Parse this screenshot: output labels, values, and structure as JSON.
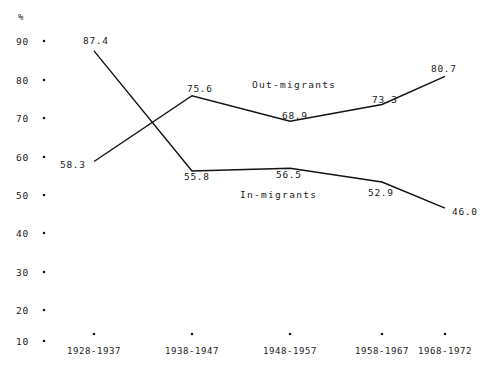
{
  "chart_data": {
    "type": "line",
    "title": "",
    "xlabel": "",
    "ylabel": "%",
    "ylim": [
      10,
      90
    ],
    "ytick_step": 10,
    "grid": false,
    "legend_position": "inline-annotation",
    "yticks": [
      "90",
      "80",
      "70",
      "60",
      "50",
      "40",
      "30",
      "20",
      "10"
    ],
    "categories": [
      "1928-1937",
      "1938-1947",
      "1948-1957",
      "1958-1967",
      "1968-1972"
    ],
    "series": [
      {
        "name": "Out-migrants",
        "values": [
          58.3,
          75.6,
          68.9,
          73.3,
          80.7
        ],
        "labels": [
          "58.3",
          "75.6",
          "68.9",
          "73.3",
          "80.7"
        ]
      },
      {
        "name": "In-migrants",
        "values": [
          87.4,
          55.8,
          56.5,
          52.9,
          46.0
        ],
        "labels": [
          "87.4",
          "55.8",
          "56.5",
          "52.9",
          "46.0"
        ]
      }
    ]
  },
  "axis": {
    "unit_symbol": "%"
  },
  "annotations": {
    "out_migrants_label": "Out-migrants",
    "in_migrants_label": "In-migrants"
  },
  "colors": {
    "line": "#111111",
    "text": "#1a1a1a",
    "background": "#ffffff"
  }
}
